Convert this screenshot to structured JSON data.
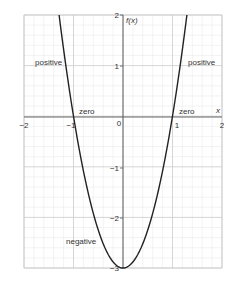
{
  "chart_data": {
    "type": "line",
    "title": "",
    "function": "f(x) = 3x^2 - 3",
    "xlabel": "x",
    "ylabel": "f(x)",
    "xlim": [
      -2,
      2
    ],
    "ylim": [
      -3,
      2
    ],
    "x_ticks": [
      -2,
      -1,
      0,
      1,
      2
    ],
    "y_ticks": [
      2,
      1,
      -1,
      -2,
      -3
    ],
    "x_tick_labels": [
      "−2",
      "−1",
      "0",
      "1",
      "2"
    ],
    "y_tick_labels": [
      "2",
      "1",
      "−1",
      "−2",
      "−3"
    ],
    "grid": true,
    "minor_grid_step": 0.2,
    "series": [
      {
        "name": "f(x)",
        "x": [
          -1.29,
          -1.0,
          -0.5,
          0,
          0.5,
          1.0,
          1.29
        ],
        "y": [
          2.0,
          0.0,
          -2.25,
          -3.0,
          -2.25,
          0.0,
          2.0
        ]
      }
    ],
    "annotations": [
      {
        "text": "positive",
        "x": -1.6,
        "y": 1.0
      },
      {
        "text": "positive",
        "x": 1.6,
        "y": 1.0
      },
      {
        "text": "zero",
        "x": -0.75,
        "y": 0.08
      },
      {
        "text": "zero",
        "x": 1.25,
        "y": 0.08
      },
      {
        "text": "negative",
        "x": -0.85,
        "y": -2.6
      }
    ],
    "legend": "none"
  },
  "labels": {
    "y_axis_name": "f(x)",
    "x_axis_name": "x",
    "positive_left": "positive",
    "positive_right": "positive",
    "zero_left": "zero",
    "zero_right": "zero",
    "negative": "negative",
    "tick_xm2": "−2",
    "tick_xm1": "−1",
    "tick_x0": "0",
    "tick_x1": "1",
    "tick_x2": "2",
    "tick_y2": "2",
    "tick_y1": "1",
    "tick_ym1": "−1",
    "tick_ym2": "−2",
    "tick_ym3": "−3"
  },
  "colors": {
    "curve": "#222222",
    "axis": "#555555",
    "major_grid": "#cccccc",
    "minor_grid": "#e6e6e6"
  }
}
